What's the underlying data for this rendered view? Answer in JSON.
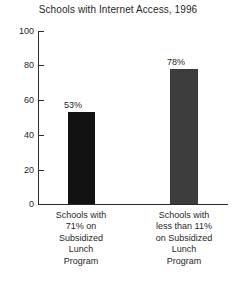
{
  "chart_data": {
    "type": "bar",
    "title": "Schools with Internet Access, 1996",
    "xlabel": "",
    "ylabel": "",
    "ylim": [
      0,
      100
    ],
    "yticks": [
      0,
      20,
      40,
      60,
      80,
      100
    ],
    "ytick_labels": [
      "0",
      "20",
      "40",
      "60",
      "80",
      "100"
    ],
    "grid": false,
    "legend": false,
    "legend_position": "none",
    "categories": [
      "Schools with 71% on Subsidized Lunch Program",
      "Schools with less than 11% on Subsidized Lunch Program"
    ],
    "category_lines": [
      [
        "Schools with",
        "71% on",
        "Subsidized",
        "Lunch",
        "Program"
      ],
      [
        "Schools with",
        "less than 11%",
        "on Subsidized",
        "Lunch",
        "Program"
      ]
    ],
    "values": [
      53,
      78
    ],
    "data_labels": [
      "53%",
      "78%"
    ],
    "bar_colors": [
      "#121212",
      "#3c3c3c"
    ],
    "axis_color": "#2b2b2b",
    "text_color": "#1f1f1f",
    "background_color": "#ffffff"
  }
}
